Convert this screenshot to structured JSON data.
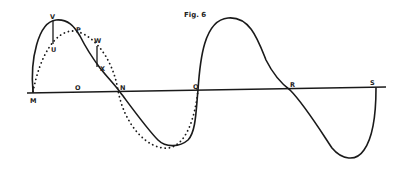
{
  "figure": {
    "title": "Fig. 6",
    "axis_points": [
      {
        "id": "M",
        "label": "M",
        "x": 33,
        "y": 100
      },
      {
        "id": "O",
        "label": "O",
        "x": 78,
        "y": 89
      },
      {
        "id": "N",
        "label": "N",
        "x": 121,
        "y": 89
      },
      {
        "id": "Q",
        "label": "Q",
        "x": 195,
        "y": 89
      },
      {
        "id": "R",
        "label": "R",
        "x": 292,
        "y": 87
      },
      {
        "id": "S",
        "label": "S",
        "x": 372,
        "y": 85
      }
    ],
    "curve_points": [
      {
        "id": "V",
        "label": "V",
        "x": 51,
        "y": 18
      },
      {
        "id": "U",
        "label": "U",
        "x": 52,
        "y": 51
      },
      {
        "id": "P",
        "label": "P",
        "x": 77,
        "y": 31
      },
      {
        "id": "W",
        "label": "W",
        "x": 95,
        "y": 41
      },
      {
        "id": "X",
        "label": "X",
        "x": 100,
        "y": 70
      }
    ],
    "curves": {
      "solid": "distorted wave M-V-P-X-N-trough-Q-crest-R-trough-S",
      "dotted": "sine wave M-P-W-N-trough-Q"
    },
    "colors": {
      "ink": "#1a1a1a",
      "paper": "#ffffff"
    }
  }
}
